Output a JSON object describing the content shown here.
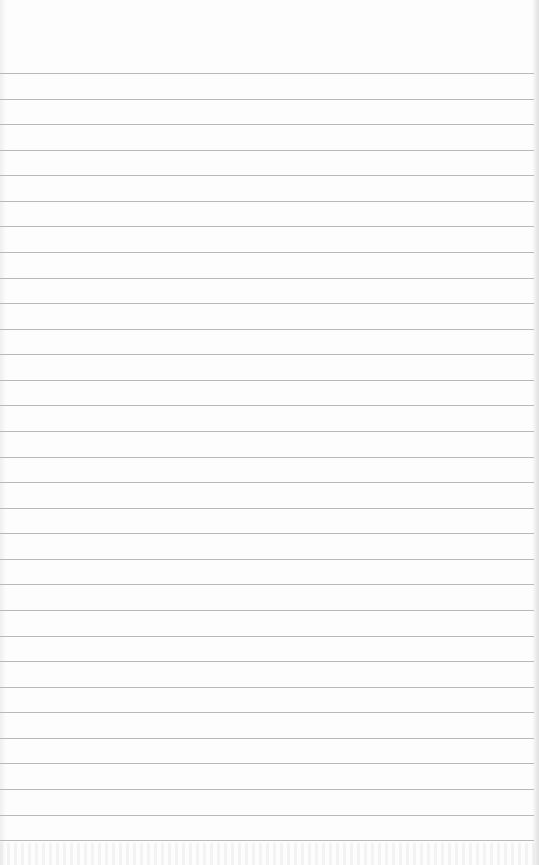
{
  "sheet": {
    "type": "lined-paper",
    "background_color": "#fdfdfd",
    "line_color": "#b9b9b9",
    "line_count": 31,
    "first_line_y": 73,
    "line_spacing_px": 25.57,
    "line_width_px": 534
  }
}
